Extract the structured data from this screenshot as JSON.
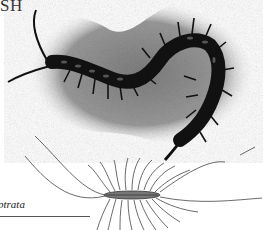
{
  "page": {
    "heading_fragment": "SH",
    "figures": [
      {
        "name": "centipede-photo",
        "description": "Black-and-white photograph of a dark centipede on textured sand, body curled into an S shape",
        "icon": "centipede-photo-icon"
      },
      {
        "name": "house-centipede-illustration",
        "description": "Line drawing of a long-legged house centipede",
        "icon": "house-centipede-drawing-icon"
      }
    ],
    "caption_fragment": "ptrata"
  },
  "colors": {
    "background": "#ffffff",
    "photo_dark": "#111111",
    "photo_ground": "#8a8a8a",
    "ink": "#333333"
  }
}
